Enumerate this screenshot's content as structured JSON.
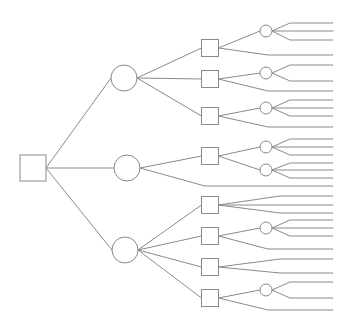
{
  "diagram": {
    "type": "decision-tree",
    "stroke_color": "#8a8a8a",
    "fill_color": "#ffffff",
    "width": 352,
    "height": 327,
    "root": {
      "id": "root",
      "shape": "square",
      "x": 33,
      "y": 168,
      "size": 26
    },
    "chance_nodes_large": [
      {
        "id": "c1",
        "x": 124,
        "y": 78,
        "r": 13
      },
      {
        "id": "c2",
        "x": 127,
        "y": 168,
        "r": 13
      },
      {
        "id": "c3",
        "x": 125,
        "y": 250,
        "r": 13
      }
    ],
    "decision_nodes": [
      {
        "id": "s1",
        "x": 210,
        "y": 48,
        "size": 17,
        "parent": "c1"
      },
      {
        "id": "s2",
        "x": 210,
        "y": 79,
        "size": 17,
        "parent": "c1"
      },
      {
        "id": "s3",
        "x": 210,
        "y": 116,
        "size": 17,
        "parent": "c1"
      },
      {
        "id": "s4",
        "x": 210,
        "y": 156,
        "size": 17,
        "parent": "c2"
      },
      {
        "id": "s5",
        "x": 210,
        "y": 205,
        "size": 17,
        "parent": "c3"
      },
      {
        "id": "s6",
        "x": 210,
        "y": 236,
        "size": 17,
        "parent": "c3"
      },
      {
        "id": "s7",
        "x": 210,
        "y": 267,
        "size": 17,
        "parent": "c3"
      },
      {
        "id": "s8",
        "x": 210,
        "y": 298,
        "size": 17,
        "parent": "c3"
      }
    ],
    "chance_nodes_small": [
      {
        "id": "ca",
        "x": 266,
        "y": 31,
        "r": 6,
        "parent": "s1",
        "leaves": [
          23,
          31,
          40
        ]
      },
      {
        "id": "cb",
        "x": 266,
        "y": 73,
        "r": 6,
        "parent": "s2",
        "leaves": [
          65,
          81
        ]
      },
      {
        "id": "cc",
        "x": 266,
        "y": 108,
        "r": 6,
        "parent": "s3",
        "leaves": [
          100,
          108,
          116
        ]
      },
      {
        "id": "cd",
        "x": 266,
        "y": 147,
        "r": 6,
        "parent": "s4",
        "leaves": [
          139,
          147,
          155
        ]
      },
      {
        "id": "ce",
        "x": 266,
        "y": 170,
        "r": 6,
        "parent": "s4",
        "leaves": [
          163,
          170,
          178
        ]
      },
      {
        "id": "cf",
        "x": 266,
        "y": 228,
        "r": 6,
        "parent": "s6",
        "leaves": [
          220,
          228,
          236
        ]
      },
      {
        "id": "cg",
        "x": 266,
        "y": 290,
        "r": 6,
        "parent": "s8",
        "leaves": [
          282,
          298
        ]
      }
    ],
    "direct_leaves": [
      {
        "from": "s1",
        "y": 55,
        "bend_x": 268
      },
      {
        "from": "s2",
        "y": 91,
        "bend_x": 268
      },
      {
        "from": "s3",
        "y": 127,
        "bend_x": 268
      },
      {
        "from": "c2",
        "y": 186,
        "bend_x": 205
      },
      {
        "from": "s5",
        "y": 196,
        "bend_x": 280
      },
      {
        "from": "s5",
        "y": 205,
        "bend_x": 280
      },
      {
        "from": "s5",
        "y": 213,
        "bend_x": 280
      },
      {
        "from": "s6",
        "y": 249,
        "bend_x": 268
      },
      {
        "from": "s7",
        "y": 259,
        "bend_x": 280
      },
      {
        "from": "s7",
        "y": 273,
        "bend_x": 280
      },
      {
        "from": "s8",
        "y": 310,
        "bend_x": 268
      }
    ],
    "leaf_end_x": 333,
    "small_leaf_bend_x": 290
  }
}
